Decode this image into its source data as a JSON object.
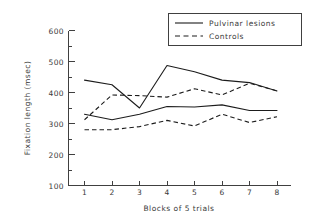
{
  "chart_data": {
    "type": "line",
    "title": "",
    "xlabel": "Blocks of 5 trials",
    "ylabel": "Fixation length (msec)",
    "x": [
      1,
      2,
      3,
      4,
      5,
      6,
      7,
      8
    ],
    "xlim": [
      0.4,
      8.6
    ],
    "ylim": [
      100,
      600
    ],
    "xticks": [
      "1",
      "2",
      "3",
      "4",
      "5",
      "6",
      "7",
      "8"
    ],
    "yticks": [
      "100",
      "200",
      "300",
      "400",
      "500",
      "600"
    ],
    "yticks_minor": [
      150,
      250,
      350,
      450,
      550
    ],
    "grid": false,
    "legend_position": "top-right",
    "legend": [
      "Pulvinar lesions",
      "Controls"
    ],
    "series": [
      {
        "name": "Pulvinar lesions (upper)",
        "style": "solid",
        "values": [
          440,
          425,
          350,
          487,
          467,
          440,
          432,
          405
        ]
      },
      {
        "name": "Controls (upper)",
        "style": "dashed",
        "values": [
          312,
          392,
          390,
          385,
          412,
          392,
          430,
          405
        ]
      },
      {
        "name": "Pulvinar lesions (lower)",
        "style": "solid",
        "values": [
          330,
          312,
          330,
          355,
          353,
          360,
          342,
          342
        ]
      },
      {
        "name": "Controls (lower)",
        "style": "dashed",
        "values": [
          280,
          280,
          290,
          310,
          292,
          330,
          303,
          322
        ]
      }
    ]
  },
  "axis": {
    "y_title": "Fixation length (msec)",
    "x_title": "Blocks of 5 trials",
    "y_tick_600": "600",
    "y_tick_500": "500",
    "y_tick_400": "400",
    "y_tick_300": "300",
    "y_tick_200": "200",
    "y_tick_100": "100",
    "x_tick_1": "1",
    "x_tick_2": "2",
    "x_tick_3": "3",
    "x_tick_4": "4",
    "x_tick_5": "5",
    "x_tick_6": "6",
    "x_tick_7": "7",
    "x_tick_8": "8"
  },
  "legend": {
    "entry_1": "Pulvinar lesions",
    "entry_2": "Controls"
  },
  "colors": {
    "ink": "#1c1c1c",
    "axis": "#404040",
    "background": "#ffffff"
  }
}
